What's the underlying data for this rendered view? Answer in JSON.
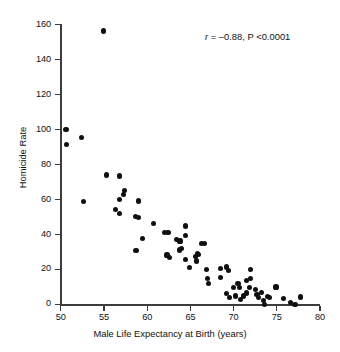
{
  "chart_data": {
    "type": "scatter",
    "title": "",
    "xlabel": "Male Life Expectancy at Birth (years)",
    "ylabel": "Homicide Rate",
    "xlim": [
      50,
      80
    ],
    "ylim": [
      0,
      160
    ],
    "xticks": [
      50,
      55,
      60,
      65,
      70,
      75,
      80
    ],
    "yticks": [
      0,
      20,
      40,
      60,
      80,
      100,
      120,
      140,
      160
    ],
    "grid": false,
    "legend": null,
    "annotations": [
      {
        "name": "correlation-statistic",
        "text": "r = –0.88, P <0.0001",
        "r": -0.88,
        "p_value": "<0.0001",
        "x": 68.5,
        "y": 150
      }
    ],
    "series": [
      {
        "name": "Countries",
        "marker": "filled-circle",
        "color": "#101010",
        "points": [
          [
            50.6,
            100.1
          ],
          [
            50.7,
            91.3
          ],
          [
            52.4,
            95.5
          ],
          [
            52.6,
            58.8
          ],
          [
            54.9,
            156.5
          ],
          [
            55.3,
            74.1
          ],
          [
            56.3,
            54.1
          ],
          [
            56.8,
            73.5
          ],
          [
            56.8,
            59.8
          ],
          [
            56.8,
            51.9
          ],
          [
            57.3,
            63.0
          ],
          [
            57.4,
            65.0
          ],
          [
            58.6,
            50.2
          ],
          [
            58.7,
            30.8
          ],
          [
            59.0,
            59.2
          ],
          [
            59.0,
            49.6
          ],
          [
            59.5,
            37.6
          ],
          [
            60.7,
            46.4
          ],
          [
            62.0,
            41.0
          ],
          [
            62.4,
            41.0
          ],
          [
            62.3,
            28.3
          ],
          [
            62.6,
            26.8
          ],
          [
            63.4,
            37.2
          ],
          [
            63.8,
            36.3
          ],
          [
            63.7,
            31.1
          ],
          [
            64.0,
            32.0
          ],
          [
            64.4,
            44.9
          ],
          [
            64.4,
            39.2
          ],
          [
            64.4,
            25.8
          ],
          [
            64.9,
            21.0
          ],
          [
            65.6,
            27.3
          ],
          [
            65.7,
            24.8
          ],
          [
            65.8,
            29.0
          ],
          [
            65.9,
            28.5
          ],
          [
            66.3,
            35.0
          ],
          [
            66.6,
            34.8
          ],
          [
            66.9,
            20.0
          ],
          [
            67.0,
            14.8
          ],
          [
            67.1,
            11.9
          ],
          [
            68.5,
            20.6
          ],
          [
            68.5,
            15.6
          ],
          [
            69.2,
            21.4
          ],
          [
            69.4,
            19.6
          ],
          [
            69.2,
            6.1
          ],
          [
            69.5,
            3.8
          ],
          [
            70.0,
            9.6
          ],
          [
            70.2,
            4.8
          ],
          [
            70.5,
            12.0
          ],
          [
            70.7,
            9.6
          ],
          [
            70.8,
            2.8
          ],
          [
            71.1,
            4.8
          ],
          [
            71.5,
            13.7
          ],
          [
            71.8,
            9.6
          ],
          [
            71.5,
            6.5
          ],
          [
            72.0,
            20.0
          ],
          [
            72.0,
            15.0
          ],
          [
            72.7,
            5.7
          ],
          [
            72.5,
            8.5
          ],
          [
            72.9,
            3.8
          ],
          [
            73.2,
            6.8
          ],
          [
            73.5,
            2.0
          ],
          [
            73.9,
            4.4
          ],
          [
            73.6,
            0.0
          ],
          [
            74.2,
            4.0
          ],
          [
            74.9,
            10.0
          ],
          [
            75.8,
            3.4
          ],
          [
            76.6,
            1.0
          ],
          [
            77.1,
            0.0
          ],
          [
            77.7,
            4.2
          ]
        ]
      }
    ]
  },
  "axes": {
    "y_label": "Homicide Rate",
    "x_label": "Male Life Expectancy at Birth (years)",
    "y_tick_labels": [
      "160",
      "140",
      "120",
      "100",
      "80",
      "60",
      "40",
      "20",
      "0"
    ],
    "x_tick_labels": [
      "50",
      "55",
      "60",
      "65",
      "70",
      "75",
      "80"
    ]
  },
  "annotation": {
    "r_symbol": "r",
    "rest": " = –0.88, P <0.0001"
  },
  "colors": {
    "marker": "#101010",
    "axis": "#3c3c3c",
    "text": "#111111",
    "background": "#ffffff"
  }
}
